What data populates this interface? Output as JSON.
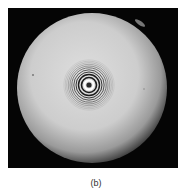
{
  "figure": {
    "label": "(b)",
    "image": {
      "subject": "interference-rings-photograph",
      "background_color": "#050505",
      "disc_color": "#cfcfcf",
      "ring_color": "#1a1a1a",
      "ring_count": 10
    }
  }
}
